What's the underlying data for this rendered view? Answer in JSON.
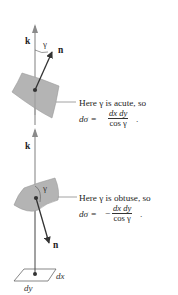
{
  "figure": {
    "top_case": {
      "k_label": "k",
      "n_label": "n",
      "gamma_label": "γ",
      "note": "Here γ is acute, so",
      "eq_lhs": "dσ =",
      "eq_sign": "",
      "frac_num": "dx dy",
      "frac_den": "cos γ",
      "eq_end": "."
    },
    "bottom_case": {
      "k_label": "k",
      "n_label": "n",
      "gamma_label": "γ",
      "note": "Here γ is obtuse, so",
      "eq_lhs": "dσ =",
      "eq_sign": "−",
      "frac_num": "dx dy",
      "frac_den": "cos γ",
      "eq_end": "."
    },
    "base": {
      "dx_label": "dx",
      "dy_label": "dy"
    },
    "colors": {
      "axis": "#8a8a8a",
      "arrow": "#333333",
      "surface_fill": "#b4b4b4",
      "surface_edge": "#8c8c8c",
      "leader": "#8a8a8a"
    }
  }
}
